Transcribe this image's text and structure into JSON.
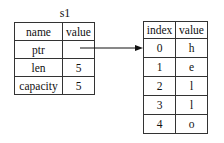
{
  "diagram": {
    "left_table": {
      "title": "s1",
      "headers": [
        "name",
        "value"
      ],
      "rows": [
        {
          "name": "ptr",
          "value": ""
        },
        {
          "name": "len",
          "value": "5"
        },
        {
          "name": "capacity",
          "value": "5"
        }
      ]
    },
    "right_table": {
      "headers": [
        "index",
        "value"
      ],
      "rows": [
        {
          "index": "0",
          "value": "h"
        },
        {
          "index": "1",
          "value": "e"
        },
        {
          "index": "2",
          "value": "l"
        },
        {
          "index": "3",
          "value": "l"
        },
        {
          "index": "4",
          "value": "o"
        }
      ]
    },
    "arrow": {
      "from": "ptr",
      "to": "index 0",
      "color": "#111111"
    }
  }
}
